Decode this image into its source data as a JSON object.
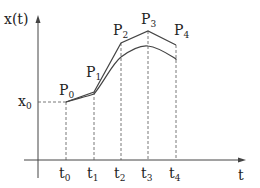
{
  "diagram": {
    "y_axis_label": "x(t)",
    "x_axis_label": "t",
    "initial_value_label": {
      "base": "x",
      "sub": "0"
    },
    "time_ticks": [
      {
        "base": "t",
        "sub": "0",
        "x": 66
      },
      {
        "base": "t",
        "sub": "1",
        "x": 94
      },
      {
        "base": "t",
        "sub": "2",
        "x": 121
      },
      {
        "base": "t",
        "sub": "3",
        "x": 148
      },
      {
        "base": "t",
        "sub": "4",
        "x": 176
      }
    ],
    "points": [
      {
        "base": "P",
        "sub": "0",
        "x": 66,
        "y": 102
      },
      {
        "base": "P",
        "sub": "1",
        "x": 94,
        "y": 92
      },
      {
        "base": "P",
        "sub": "2",
        "x": 121,
        "y": 43
      },
      {
        "base": "P",
        "sub": "3",
        "x": 148,
        "y": 31
      },
      {
        "base": "P",
        "sub": "4",
        "x": 176,
        "y": 45
      }
    ],
    "smooth_curve_y": [
      102,
      94,
      57,
      46,
      59
    ],
    "colors": {
      "line": "#444444",
      "background": "#ffffff"
    }
  }
}
